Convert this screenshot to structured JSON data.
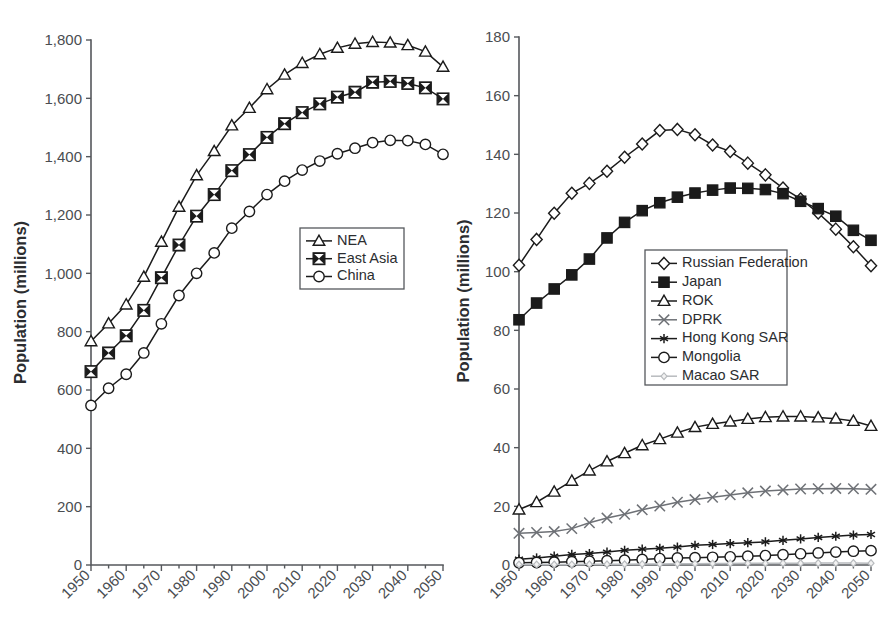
{
  "figure": {
    "title": "",
    "panels": [
      "left",
      "right"
    ]
  },
  "chart_data": [
    {
      "panel": "left",
      "type": "line",
      "title": "",
      "xlabel": "",
      "ylabel": "Population (millions)",
      "x": [
        1950,
        1955,
        1960,
        1965,
        1970,
        1975,
        1980,
        1985,
        1990,
        1995,
        2000,
        2005,
        2010,
        2015,
        2020,
        2025,
        2030,
        2035,
        2040,
        2045,
        2050
      ],
      "xlim": [
        1950,
        2050
      ],
      "ylim": [
        0,
        1800
      ],
      "xticks": [
        1950,
        1960,
        1970,
        1980,
        1990,
        2000,
        2010,
        2020,
        2030,
        2040,
        2050
      ],
      "xticklabels": [
        "1950",
        "1960",
        "1970",
        "1980",
        "1990",
        "2000",
        "2010",
        "2020",
        "2030",
        "2040",
        "2050"
      ],
      "yticks": [
        0,
        200,
        400,
        600,
        800,
        1000,
        1200,
        1400,
        1600,
        1800
      ],
      "yticklabels": [
        "0",
        "200",
        "400",
        "600",
        "800",
        "1,000",
        "1,200",
        "1,400",
        "1,600",
        "1,800"
      ],
      "grid": false,
      "legend_position": "center-right",
      "series": [
        {
          "name": "NEA",
          "marker": "triangle-open",
          "color": "#1b1b1b",
          "values": [
            767,
            828,
            893,
            988,
            1108,
            1228,
            1336,
            1419,
            1507,
            1567,
            1631,
            1681,
            1721,
            1751,
            1773,
            1787,
            1793,
            1791,
            1782,
            1760,
            1708
          ]
        },
        {
          "name": "East Asia",
          "marker": "square-bowtie",
          "color": "#1b1b1b",
          "values": [
            663,
            727,
            786,
            873,
            985,
            1097,
            1196,
            1270,
            1352,
            1407,
            1466,
            1513,
            1551,
            1581,
            1604,
            1621,
            1655,
            1658,
            1651,
            1636,
            1598
          ]
        },
        {
          "name": "China",
          "marker": "circle-open",
          "color": "#1b1b1b",
          "values": [
            547,
            606,
            654,
            727,
            827,
            924,
            1000,
            1070,
            1155,
            1212,
            1270,
            1316,
            1354,
            1385,
            1410,
            1429,
            1448,
            1456,
            1455,
            1442,
            1408
          ]
        }
      ]
    },
    {
      "panel": "right",
      "type": "line",
      "title": "",
      "xlabel": "",
      "ylabel": "Population (millions)",
      "x": [
        1950,
        1955,
        1960,
        1965,
        1970,
        1975,
        1980,
        1985,
        1990,
        1995,
        2000,
        2005,
        2010,
        2015,
        2020,
        2025,
        2030,
        2035,
        2040,
        2045,
        2050
      ],
      "xlim": [
        1950,
        2050
      ],
      "ylim": [
        0,
        180
      ],
      "xticks": [
        1950,
        1960,
        1970,
        1980,
        1990,
        2000,
        2010,
        2020,
        2030,
        2040,
        2050
      ],
      "xticklabels": [
        "1950",
        "1960",
        "1970",
        "1980",
        "1990",
        "2000",
        "2010",
        "2020",
        "2030",
        "2040",
        "2050"
      ],
      "yticks": [
        0,
        20,
        40,
        60,
        80,
        100,
        120,
        140,
        160,
        180
      ],
      "yticklabels": [
        "0",
        "20",
        "40",
        "60",
        "80",
        "100",
        "120",
        "140",
        "160",
        "180"
      ],
      "grid": false,
      "legend_position": "center",
      "series": [
        {
          "name": "Russian Federation",
          "marker": "diamond-open",
          "color": "#1b1b1b",
          "values": [
            102.2,
            111.0,
            119.9,
            126.7,
            130.1,
            134.2,
            139.0,
            143.5,
            148.1,
            148.5,
            146.7,
            143.2,
            141.0,
            137.0,
            133.0,
            128.5,
            124.8,
            120.0,
            114.5,
            108.5,
            102.0
          ]
        },
        {
          "name": "Japan",
          "marker": "square-filled",
          "color": "#1b1b1b",
          "values": [
            83.6,
            89.3,
            94.1,
            98.9,
            104.3,
            111.5,
            116.8,
            120.8,
            123.5,
            125.4,
            126.8,
            127.8,
            128.5,
            128.4,
            128.0,
            126.6,
            124.0,
            121.5,
            118.9,
            114.1,
            110.7
          ]
        },
        {
          "name": "ROK",
          "marker": "triangle-open",
          "color": "#1b1b1b",
          "values": [
            18.9,
            21.4,
            25.0,
            28.7,
            32.2,
            35.3,
            38.1,
            40.8,
            42.9,
            45.1,
            47.0,
            48.1,
            48.9,
            49.8,
            50.4,
            50.6,
            50.6,
            50.3,
            49.9,
            49.1,
            47.4
          ]
        },
        {
          "name": "DPRK",
          "marker": "x-cross",
          "color": "#6e7176",
          "values": [
            10.8,
            11.1,
            11.4,
            12.4,
            14.4,
            16.0,
            17.3,
            18.8,
            20.1,
            21.4,
            22.3,
            23.1,
            23.9,
            24.6,
            25.2,
            25.6,
            25.9,
            26.0,
            26.1,
            26.0,
            25.8
          ]
        },
        {
          "name": "Hong Kong SAR",
          "marker": "asterisk",
          "color": "#1b1b1b",
          "values": [
            1.97,
            2.4,
            3.0,
            3.6,
            3.9,
            4.4,
            5.0,
            5.4,
            5.7,
            6.1,
            6.7,
            7.0,
            7.3,
            7.6,
            7.9,
            8.4,
            8.9,
            9.4,
            9.8,
            10.2,
            10.4
          ]
        },
        {
          "name": "Mongolia",
          "marker": "circle-open",
          "color": "#1b1b1b",
          "values": [
            0.76,
            0.86,
            0.97,
            1.12,
            1.27,
            1.45,
            1.66,
            1.89,
            2.18,
            2.39,
            2.5,
            2.63,
            2.78,
            3.0,
            3.2,
            3.5,
            3.8,
            4.1,
            4.4,
            4.7,
            4.9
          ]
        },
        {
          "name": "Macao SAR",
          "marker": "diamond-light",
          "color": "#b8bbbe",
          "values": [
            0.19,
            0.19,
            0.17,
            0.19,
            0.25,
            0.25,
            0.25,
            0.3,
            0.37,
            0.41,
            0.44,
            0.47,
            0.54,
            0.58,
            0.6,
            0.62,
            0.63,
            0.64,
            0.64,
            0.64,
            0.63
          ]
        }
      ]
    }
  ]
}
